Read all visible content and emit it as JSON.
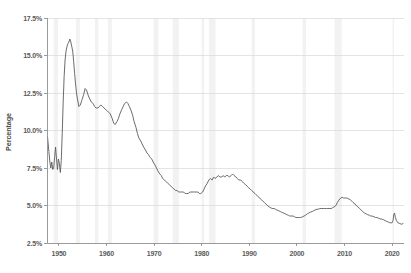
{
  "chart_data": {
    "type": "line",
    "title": "",
    "subtitle": "",
    "xlabel": "",
    "ylabel": "Percentage",
    "xlim": [
      1947.5,
      2022.5
    ],
    "ylim": [
      2.5,
      17.5
    ],
    "grid": true,
    "legend": "none",
    "y_tick_labels": [
      "17.5%",
      "15.0%",
      "12.5%",
      "10.0%",
      "7.5%",
      "5.0%",
      "2.5%"
    ],
    "y_tick_values": [
      17.5,
      15.0,
      12.5,
      10.0,
      7.5,
      5.0,
      2.5
    ],
    "x_tick_labels": [
      "1950",
      "1960",
      "1970",
      "1980",
      "1990",
      "2000",
      "2010",
      "2020"
    ],
    "x_tick_values": [
      1950,
      1960,
      1970,
      1980,
      1990,
      2000,
      2010,
      2020
    ],
    "series": [
      {
        "name": "Percentage",
        "color": "#5b5b5b",
        "x": [
          1947.6,
          1947.9,
          1948.1,
          1948.3,
          1948.5,
          1948.7,
          1948.9,
          1949.1,
          1949.3,
          1949.5,
          1949.7,
          1949.9,
          1950.1,
          1950.3,
          1950.5,
          1950.7,
          1950.9,
          1951.1,
          1951.3,
          1951.5,
          1951.7,
          1951.9,
          1952.1,
          1952.3,
          1952.5,
          1952.7,
          1952.9,
          1953.1,
          1953.3,
          1953.5,
          1953.7,
          1953.9,
          1954.2,
          1954.5,
          1954.8,
          1955.2,
          1955.5,
          1955.8,
          1956.2,
          1956.5,
          1956.8,
          1957.2,
          1957.5,
          1957.8,
          1958.2,
          1958.5,
          1958.8,
          1959.2,
          1959.5,
          1959.8,
          1960.2,
          1960.5,
          1960.8,
          1961.2,
          1961.5,
          1961.8,
          1962.2,
          1962.5,
          1962.8,
          1963.2,
          1963.5,
          1963.8,
          1964.2,
          1964.5,
          1964.8,
          1965.2,
          1965.5,
          1965.8,
          1966.2,
          1966.5,
          1966.8,
          1967.2,
          1967.5,
          1967.8,
          1968.2,
          1968.5,
          1968.8,
          1969.2,
          1969.5,
          1969.8,
          1970.2,
          1970.5,
          1970.8,
          1971.2,
          1971.5,
          1971.8,
          1972.2,
          1972.5,
          1972.8,
          1973.2,
          1973.5,
          1973.8,
          1974.2,
          1974.5,
          1974.8,
          1975.2,
          1975.5,
          1975.8,
          1976.2,
          1976.5,
          1976.8,
          1977.2,
          1977.5,
          1977.8,
          1978.2,
          1978.5,
          1978.8,
          1979.2,
          1979.5,
          1979.8,
          1980.2,
          1980.5,
          1980.8,
          1981.2,
          1981.5,
          1981.8,
          1982.2,
          1982.5,
          1982.8,
          1983.2,
          1983.5,
          1983.8,
          1984.2,
          1984.5,
          1984.8,
          1985.2,
          1985.5,
          1985.8,
          1986.2,
          1986.5,
          1986.8,
          1987.2,
          1987.5,
          1987.8,
          1988.2,
          1988.5,
          1988.8,
          1989.2,
          1989.5,
          1989.8,
          1990.2,
          1990.5,
          1990.8,
          1991.2,
          1991.5,
          1991.8,
          1992.2,
          1992.5,
          1992.8,
          1993.2,
          1993.5,
          1993.8,
          1994.2,
          1994.5,
          1994.8,
          1995.2,
          1995.5,
          1995.8,
          1996.2,
          1996.5,
          1996.8,
          1997.2,
          1997.5,
          1997.8,
          1998.2,
          1998.5,
          1998.8,
          1999.2,
          1999.5,
          1999.8,
          2000.2,
          2000.5,
          2000.8,
          2001.2,
          2001.5,
          2001.8,
          2002.2,
          2002.5,
          2002.8,
          2003.2,
          2003.5,
          2003.8,
          2004.2,
          2004.5,
          2004.8,
          2005.2,
          2005.5,
          2005.8,
          2006.2,
          2006.5,
          2006.8,
          2007.2,
          2007.5,
          2007.8,
          2008.2,
          2008.5,
          2008.8,
          2009.2,
          2009.5,
          2009.8,
          2010.2,
          2010.5,
          2010.8,
          2011.2,
          2011.5,
          2011.8,
          2012.2,
          2012.5,
          2012.8,
          2013.2,
          2013.5,
          2013.8,
          2014.2,
          2014.5,
          2014.8,
          2015.2,
          2015.5,
          2015.8,
          2016.2,
          2016.5,
          2016.8,
          2017.2,
          2017.5,
          2017.8,
          2018.2,
          2018.5,
          2018.8,
          2019.2,
          2019.5,
          2019.8,
          2020.0,
          2020.2,
          2020.35,
          2020.5,
          2020.7,
          2020.9,
          2021.2,
          2021.6,
          2022.0,
          2022.3
        ],
        "y": [
          9.6,
          8.6,
          7.9,
          7.5,
          7.9,
          7.4,
          7.5,
          8.2,
          8.9,
          8.1,
          7.4,
          8.1,
          7.8,
          7.2,
          8.0,
          9.8,
          11.9,
          13.6,
          14.7,
          15.3,
          15.6,
          15.8,
          15.9,
          16.1,
          15.9,
          15.6,
          15.3,
          14.6,
          13.8,
          13.1,
          12.5,
          12.1,
          11.6,
          11.7,
          12.0,
          12.4,
          12.8,
          12.7,
          12.3,
          12.1,
          11.9,
          11.8,
          11.6,
          11.5,
          11.5,
          11.6,
          11.7,
          11.6,
          11.5,
          11.4,
          11.3,
          11.2,
          11.1,
          10.8,
          10.5,
          10.4,
          10.6,
          10.8,
          11.1,
          11.4,
          11.6,
          11.8,
          11.9,
          11.8,
          11.6,
          11.3,
          11.0,
          10.6,
          10.2,
          9.8,
          9.5,
          9.3,
          9.1,
          8.9,
          8.7,
          8.5,
          8.4,
          8.2,
          8.1,
          7.9,
          7.7,
          7.5,
          7.3,
          7.1,
          7.0,
          6.8,
          6.7,
          6.6,
          6.5,
          6.4,
          6.3,
          6.2,
          6.1,
          6.0,
          6.0,
          5.9,
          5.9,
          5.9,
          5.9,
          5.8,
          5.8,
          5.8,
          5.9,
          5.9,
          5.9,
          5.9,
          5.9,
          5.9,
          5.8,
          5.8,
          5.9,
          6.1,
          6.3,
          6.5,
          6.7,
          6.8,
          6.7,
          6.9,
          6.8,
          6.9,
          7.0,
          6.9,
          6.9,
          7.0,
          6.9,
          7.0,
          7.0,
          6.9,
          7.0,
          7.1,
          7.0,
          6.9,
          6.8,
          6.7,
          6.7,
          6.6,
          6.5,
          6.4,
          6.3,
          6.2,
          6.1,
          6.0,
          5.9,
          5.8,
          5.7,
          5.6,
          5.5,
          5.4,
          5.3,
          5.2,
          5.1,
          5.0,
          4.9,
          4.85,
          4.8,
          4.8,
          4.75,
          4.7,
          4.65,
          4.6,
          4.55,
          4.5,
          4.45,
          4.4,
          4.35,
          4.3,
          4.3,
          4.3,
          4.25,
          4.2,
          4.2,
          4.2,
          4.2,
          4.25,
          4.3,
          4.35,
          4.45,
          4.5,
          4.55,
          4.6,
          4.65,
          4.7,
          4.75,
          4.75,
          4.8,
          4.8,
          4.8,
          4.8,
          4.8,
          4.8,
          4.8,
          4.8,
          4.85,
          4.9,
          5.0,
          5.2,
          5.35,
          5.5,
          5.55,
          5.5,
          5.5,
          5.5,
          5.45,
          5.4,
          5.3,
          5.2,
          5.1,
          5.0,
          4.9,
          4.8,
          4.7,
          4.6,
          4.5,
          4.45,
          4.4,
          4.35,
          4.3,
          4.3,
          4.25,
          4.2,
          4.2,
          4.15,
          4.1,
          4.1,
          4.05,
          4.0,
          3.95,
          3.9,
          3.85,
          3.85,
          3.85,
          4.0,
          4.4,
          4.5,
          4.2,
          4.0,
          3.85,
          3.8,
          3.75,
          3.8
        ]
      }
    ],
    "recession_bands": [
      {
        "start": 1948.9,
        "end": 1949.8
      },
      {
        "start": 1953.6,
        "end": 1954.4
      },
      {
        "start": 1957.6,
        "end": 1958.3
      },
      {
        "start": 1960.3,
        "end": 1961.1
      },
      {
        "start": 1969.9,
        "end": 1970.9
      },
      {
        "start": 1973.9,
        "end": 1975.2
      },
      {
        "start": 1980.0,
        "end": 1980.5
      },
      {
        "start": 1981.5,
        "end": 1982.9
      },
      {
        "start": 1990.5,
        "end": 1991.2
      },
      {
        "start": 2001.2,
        "end": 2001.9
      },
      {
        "start": 2007.9,
        "end": 2009.4
      },
      {
        "start": 2020.1,
        "end": 2020.4
      }
    ]
  },
  "colors": {
    "line": "#5b5b5b",
    "gridline": "#d9d9d9",
    "axis": "#8f8f8f",
    "recession_band": "#f2f2f2",
    "tick_text": "#5a5a5a",
    "background": "#ffffff"
  }
}
